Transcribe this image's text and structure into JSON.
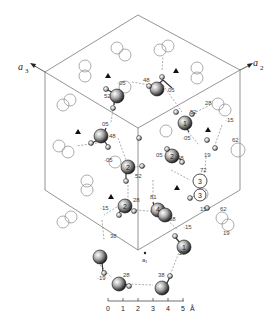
{
  "figure": {
    "type": "crystal-structure-projection",
    "axes": {
      "a2_label": "a",
      "a2_sub": "2",
      "a3_label": "a",
      "a3_sub": "3"
    },
    "hexagon_center_label": "a₁",
    "scale_bar": {
      "ticks": [
        "0",
        "1",
        "2",
        "3",
        "4",
        "5"
      ],
      "unit": "Å"
    },
    "atom_labels": {
      "a1": "1",
      "a2": "2",
      "a2b": "2",
      "a3": "3",
      "a3b": "3",
      "a4": "4",
      "a1b": "1",
      "a2c": "2",
      "a1c": "1"
    },
    "height_labels": {
      "h_05_a": "·05",
      "h_52_a": "52",
      "h_48_a": "48",
      "h_05_b": "05",
      "h_52_b": "52",
      "h_28_a": "28",
      "h_15_a": "·15",
      "h_05_c": "05",
      "h_48_b": "48",
      "h_05_d": "·05",
      "h_52_c": "52",
      "h_05_e": "·05",
      "h_05_f": "05",
      "h_48_c": "48",
      "h_62_a": "62",
      "h_19_a": "19",
      "h_72": "72",
      "h_15_b": "15",
      "h_81": "81",
      "h_28_b": "28",
      "h_15_c": "·15",
      "h_38_a": "38",
      "h_62_b": "62",
      "h_19_b": "19",
      "h_15_d": "·15",
      "h_38_b": "38",
      "h_19_c": "·19",
      "h_28_c": "28",
      "h_28_d": "28",
      "h_38_c": "38"
    },
    "colors": {
      "line": "#555555",
      "atom_dark": "#222222",
      "atom_open": "#888888"
    }
  }
}
